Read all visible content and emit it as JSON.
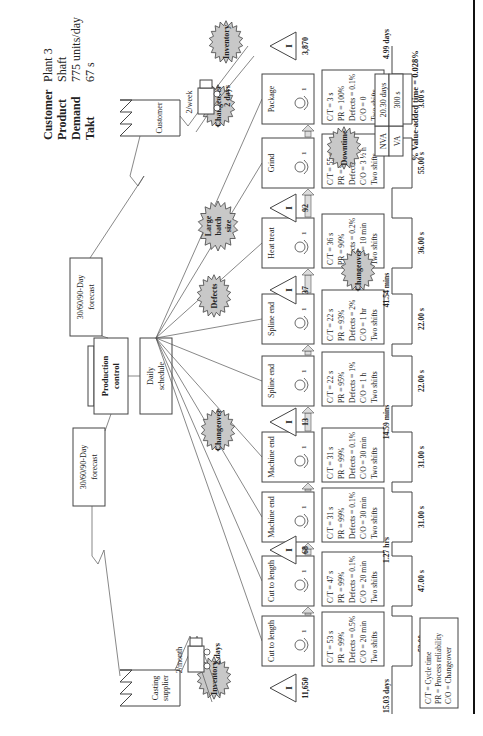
{
  "info": {
    "labels": [
      "Customer",
      "Product",
      "Demand",
      "Takt"
    ],
    "values": [
      "Plant 3",
      "Shaft",
      "775 units/day",
      "67 s"
    ]
  },
  "customer": {
    "label": "Customer"
  },
  "supplier": {
    "label_lines": [
      "Casting",
      "supplier"
    ]
  },
  "production_control": {
    "label_lines": [
      "Production",
      "control"
    ]
  },
  "daily_schedule": {
    "label_lines": [
      "Daily",
      "schedule"
    ]
  },
  "forecast_supplier": {
    "label_lines": [
      "30/60/90-Day",
      "forecast"
    ]
  },
  "forecast_customer": {
    "label_lines": [
      "30/60/90-Day",
      "forecast"
    ]
  },
  "shipment_in": {
    "frequency": "2/month",
    "lead": "2 days"
  },
  "shipment_out": {
    "frequency": "2/week",
    "lead": "2 days"
  },
  "processes": [
    {
      "name": "Cut to length",
      "operators": "1",
      "data": [
        "C/T = 53 s",
        "PR = 99%",
        "Defects = 0.5%",
        "C/O = 20 min",
        "Two shifts"
      ],
      "va": "53.00 s"
    },
    {
      "name": "Cut to length",
      "operators": "1",
      "data": [
        "C/T = 47 s",
        "PR = 99%",
        "Defects = 0.1%",
        "C/O = 20 min",
        "Two shifts"
      ],
      "va": "47.00 s"
    },
    {
      "name": "Machine end",
      "operators": "1",
      "data": [
        "C/T = 31 s",
        "PR = 99%",
        "Defects = 0.1%",
        "C/O = 30 min",
        "Two shifts"
      ],
      "va": "31.00 s"
    },
    {
      "name": "Machine end",
      "operators": "1",
      "data": [
        "C/T = 31 s",
        "PR = 99%",
        "Defects = 0.1%",
        "C/O = 30 min",
        "Two shifts"
      ],
      "va": "31.00 s"
    },
    {
      "name": "Spline end",
      "operators": "1",
      "data": [
        "C/T = 22 s",
        "PR = 95%",
        "Defects = 1%",
        "C/O = 1 h",
        "Two shifts"
      ],
      "va": "22.00 s"
    },
    {
      "name": "Spline end",
      "operators": "1",
      "data": [
        "C/T = 22 s",
        "PR = 93%",
        "Defects = 2%",
        "C/O = 1 hr",
        "Two shifts"
      ],
      "va": "22.00 s"
    },
    {
      "name": "Heat treat",
      "operators": "1",
      "data": [
        "C/T = 36 s",
        "PR = 90%",
        "Defects = 0.2%",
        "C/O = 10 min",
        "Two shifts"
      ],
      "va": "36.00 s"
    },
    {
      "name": "Grind",
      "operators": "1",
      "data": [
        "C/T = 55 s",
        "PR = 95%",
        "Defects = 1%",
        "C/O = 3 ½ h",
        "Two shifts"
      ],
      "va": "55.00 s"
    },
    {
      "name": "Package",
      "operators": "1",
      "data": [
        "C/T = 3 s",
        "PR = 100%",
        "Defects = 0.1%",
        "C/O = 0",
        "Two shifts"
      ],
      "va": "3.00 s"
    }
  ],
  "inventories": [
    {
      "count": "11,650",
      "label": "I",
      "nva": "15.03 days"
    },
    {
      "count": "68",
      "label": "I",
      "nva": "1.27 hrs"
    },
    {
      "count": "13",
      "label": "I",
      "nva": "14.59 mins"
    },
    {
      "count": "37",
      "label": "I",
      "nva": "41.54 mins"
    },
    {
      "count": "92",
      "label": "I",
      "nva": ""
    },
    {
      "count": "3,870",
      "label": "I",
      "nva": "4.99 days"
    }
  ],
  "kaizen_bursts": [
    {
      "label_lines": [
        "Inventory"
      ]
    },
    {
      "label_lines": [
        "Changeover"
      ]
    },
    {
      "label_lines": [
        "Defects"
      ]
    },
    {
      "label_lines": [
        "Large",
        "batch",
        "size"
      ]
    },
    {
      "label_lines": [
        "Changeover"
      ]
    },
    {
      "label_lines": [
        "Downtime"
      ]
    },
    {
      "label_lines": [
        "Changeover"
      ]
    },
    {
      "label_lines": [
        "Inventory"
      ]
    }
  ],
  "summary": {
    "nva_label": "NVA",
    "nva_value": "20.30 days",
    "va_label": "VA",
    "va_value": "300 s",
    "percent": "% Value-added time = 0.028%"
  },
  "legend": [
    "C/T = Cycle time",
    "PR = Process reliability",
    "C/O = Changeover"
  ]
}
